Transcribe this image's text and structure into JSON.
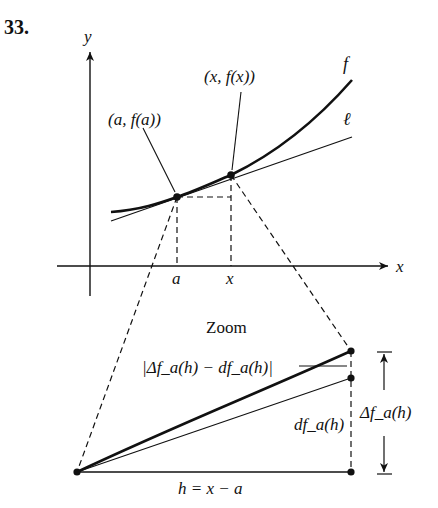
{
  "problem_number": "33.",
  "top_graph": {
    "y_axis_label": "y",
    "x_axis_label": "x",
    "curve_label": "f",
    "tangent_label": "ℓ",
    "point_a_label": "(a, f(a))",
    "point_x_label": "(x, f(x))",
    "tick_a_label": "a",
    "tick_x_label": "x"
  },
  "zoom_view": {
    "title": "Zoom",
    "error_label": "|Δf_a(h) − df_a(h)|",
    "differential_label": "df_a(h)",
    "delta_label": "Δf_a(h)",
    "base_label": "h = x − a"
  },
  "colors": {
    "ink": "#111111",
    "background": "#ffffff"
  }
}
